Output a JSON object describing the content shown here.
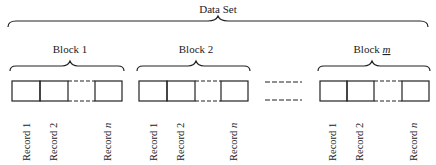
{
  "diagram": {
    "title": "Data Set",
    "blocks": [
      {
        "label": "Block 1",
        "records": [
          "Record 1",
          "Record 2",
          "Record n"
        ]
      },
      {
        "label": "Block 2",
        "records": [
          "Record 1",
          "Record 2",
          "Record n"
        ]
      },
      {
        "label": "Block m",
        "label_prefix": "Block ",
        "label_var": "m",
        "records": [
          "Record 1",
          "Record 2",
          "Record n"
        ]
      }
    ],
    "record_prefix": "Record ",
    "record_var": "n",
    "colors": {
      "line": "#222222",
      "background": "#ffffff"
    }
  }
}
